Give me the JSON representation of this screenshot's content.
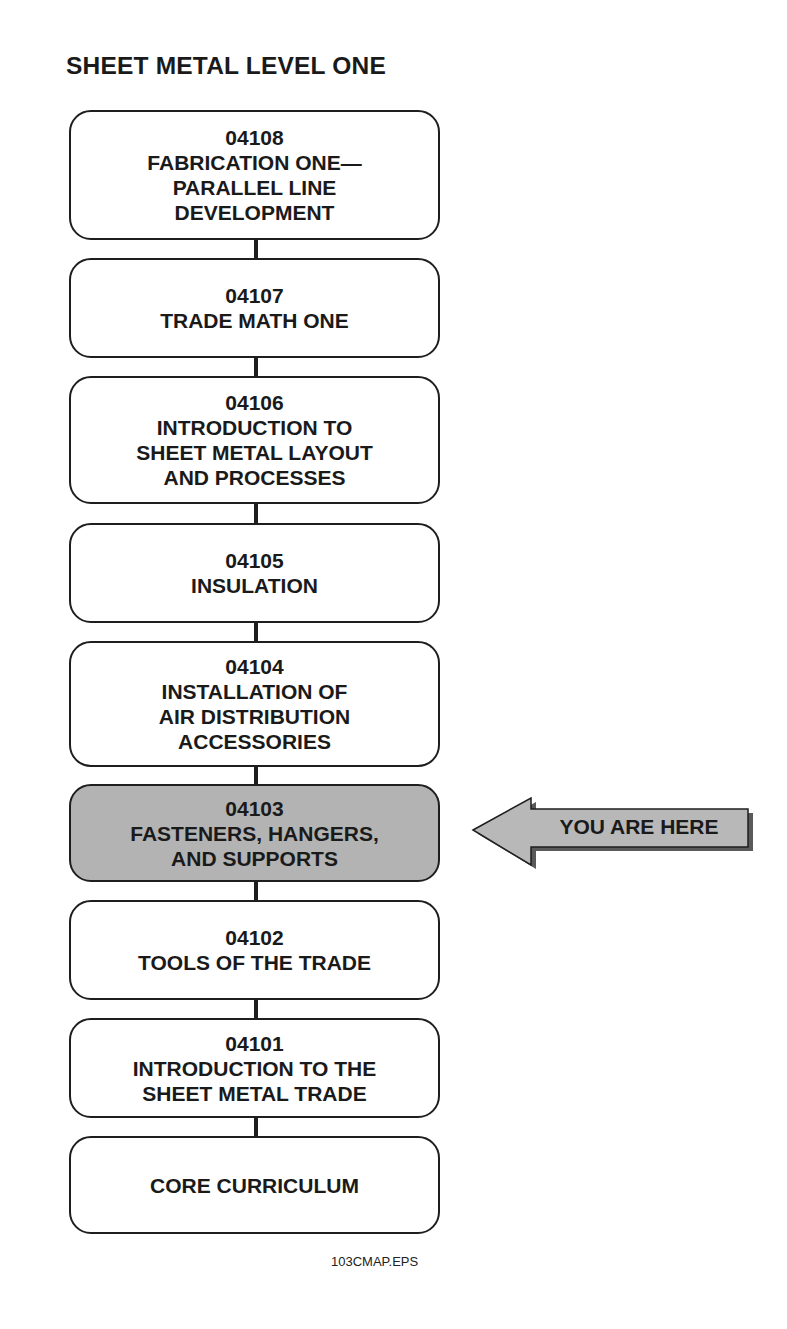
{
  "title": "SHEET METAL LEVEL ONE",
  "modules": [
    {
      "code": "04108",
      "lines": [
        "FABRICATION ONE—",
        "PARALLEL LINE",
        "DEVELOPMENT"
      ],
      "current": false
    },
    {
      "code": "04107",
      "lines": [
        "TRADE MATH ONE"
      ],
      "current": false
    },
    {
      "code": "04106",
      "lines": [
        "INTRODUCTION TO",
        "SHEET METAL LAYOUT",
        "AND PROCESSES"
      ],
      "current": false
    },
    {
      "code": "04105",
      "lines": [
        "INSULATION"
      ],
      "current": false
    },
    {
      "code": "04104",
      "lines": [
        "INSTALLATION OF",
        "AIR DISTRIBUTION",
        "ACCESSORIES"
      ],
      "current": false
    },
    {
      "code": "04103",
      "lines": [
        "FASTENERS, HANGERS,",
        "AND SUPPORTS"
      ],
      "current": true
    },
    {
      "code": "04102",
      "lines": [
        "TOOLS OF THE TRADE"
      ],
      "current": false
    },
    {
      "code": "04101",
      "lines": [
        "INTRODUCTION TO THE",
        "SHEET METAL TRADE"
      ],
      "current": false
    },
    {
      "code": "",
      "lines": [
        "CORE CURRICULUM"
      ],
      "current": false
    }
  ],
  "indicator": {
    "label": "YOU ARE HERE",
    "points_to": "04103"
  },
  "caption": "103CMAP.EPS",
  "colors": {
    "outline": "#1e1e1e",
    "highlight_fill": "#b3b3b3",
    "arrow_fill": "#b8b8b8",
    "arrow_shadow": "#5a5a5a",
    "background": "#ffffff"
  }
}
